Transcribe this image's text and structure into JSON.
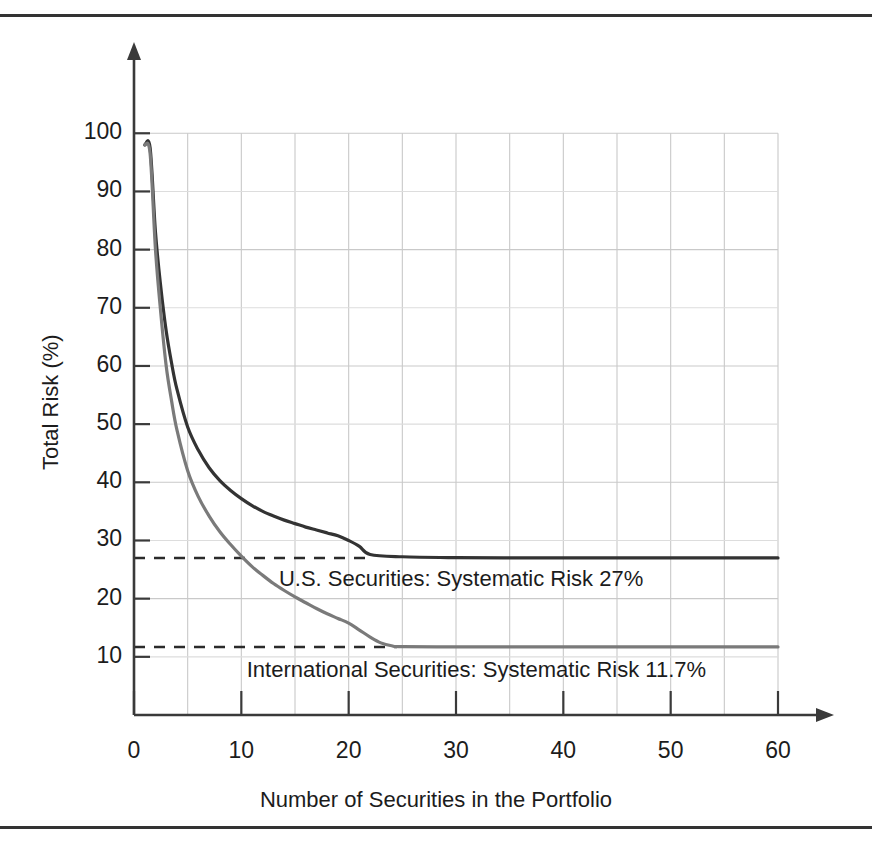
{
  "chart_data": {
    "type": "line",
    "title": "",
    "xlabel": "Number of Securities in the Portfolio",
    "ylabel": "Total Risk (%)",
    "xlim": [
      0,
      60
    ],
    "ylim": [
      0,
      104
    ],
    "xticks": [
      "0",
      "10",
      "20",
      "30",
      "40",
      "50",
      "60"
    ],
    "xtick_values": [
      0,
      10,
      20,
      30,
      40,
      50,
      60
    ],
    "yticks": [
      "10",
      "20",
      "30",
      "40",
      "50",
      "60",
      "70",
      "80",
      "90",
      "100"
    ],
    "ytick_values": [
      10,
      20,
      30,
      40,
      50,
      60,
      70,
      80,
      90,
      100
    ],
    "grid": "both-axes-minor-5-units",
    "legend_position": "inline-annotations",
    "series": [
      {
        "name": "U.S. Securities",
        "color": "#333333",
        "asymptote": 27,
        "asymptote_label": "U.S. Securities:  Systematic Risk 27%",
        "x": [
          1,
          1.5,
          2,
          2.5,
          3,
          3.5,
          4,
          5,
          6,
          7,
          8,
          9,
          10,
          11,
          12,
          13,
          14,
          15,
          16,
          17,
          18,
          19,
          20,
          21,
          22,
          25,
          30,
          35,
          40,
          45,
          50,
          55,
          60
        ],
        "y": [
          98,
          97.5,
          83,
          73.5,
          66,
          60.5,
          56,
          49.5,
          45.5,
          42.5,
          40.3,
          38.6,
          37.2,
          36,
          35,
          34.2,
          33.5,
          32.9,
          32.3,
          31.8,
          31.3,
          30.8,
          30,
          29,
          27.6,
          27.2,
          27.05,
          27,
          27,
          27,
          27,
          27,
          27
        ]
      },
      {
        "name": "International Securities",
        "color": "#7a7a7a",
        "asymptote": 11.7,
        "asymptote_label": "International Securities:  Systematic Risk 11.7%",
        "x": [
          1,
          1.5,
          2,
          2.5,
          3,
          3.5,
          4,
          5,
          6,
          7,
          8,
          9,
          10,
          11,
          12,
          13,
          14,
          15,
          16,
          17,
          18,
          19,
          20,
          21,
          22,
          23,
          24,
          25,
          30,
          35,
          40,
          45,
          50,
          55,
          60
        ],
        "y": [
          98,
          96.5,
          80,
          69,
          60,
          54,
          49,
          42,
          37.5,
          34.2,
          31.5,
          29.3,
          27.3,
          25.5,
          24,
          22.6,
          21.4,
          20.3,
          19.3,
          18.3,
          17.4,
          16.6,
          15.8,
          14.6,
          13.4,
          12.4,
          11.9,
          11.75,
          11.7,
          11.7,
          11.7,
          11.7,
          11.7,
          11.7,
          11.7
        ]
      }
    ],
    "annotations": [
      {
        "text": "U.S. Securities:  Systematic Risk 27%",
        "x": 13.5,
        "y": 23.2
      },
      {
        "text": "International Securities:  Systematic Risk 11.7%",
        "x": 10.5,
        "y": 7.6
      }
    ],
    "dashed_markers": [
      {
        "value": 27,
        "from_x": 0,
        "to_x": 22
      },
      {
        "value": 11.7,
        "from_x": 0,
        "to_x": 24.5
      }
    ]
  },
  "colors": {
    "us_curve": "#333333",
    "intl_curve": "#7a7a7a",
    "grid": "#c9c9c9",
    "grid_minor": "#dddddd",
    "axis": "#3a3a3a",
    "rule": "#333333",
    "text": "#1c1c1c"
  }
}
